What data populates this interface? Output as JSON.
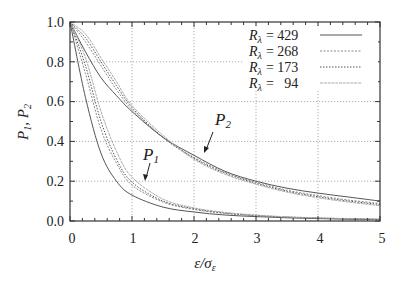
{
  "chart_data": {
    "type": "line",
    "title": "",
    "xlabel": "ε/σ_ε",
    "ylabel": "P_1, P_2",
    "xlim": [
      0,
      5
    ],
    "ylim": [
      0.0,
      1.0
    ],
    "grid": true,
    "x_ticks": [
      "0",
      "1",
      "2",
      "3",
      "4",
      "5"
    ],
    "y_ticks": [
      "0.0",
      "0.2",
      "0.4",
      "0.6",
      "0.8",
      "1.0"
    ],
    "legend_position": "upper right",
    "legend": [
      {
        "label": "R_λ = 429",
        "style": "solid",
        "color": "#555555"
      },
      {
        "label": "R_λ = 268",
        "style": "dashed",
        "color": "#888888"
      },
      {
        "label": "R_λ = 173",
        "style": "dotted",
        "color": "#555555"
      },
      {
        "label": "R_λ =   94",
        "style": "solid-light",
        "color": "#aaaaaa"
      }
    ],
    "annotations": [
      {
        "text": "P_2",
        "x": 2.35,
        "y": 0.43,
        "arrow_to": [
          2.05,
          0.31
        ]
      },
      {
        "text": "P_1",
        "x": 1.2,
        "y": 0.33,
        "arrow_to": [
          1.05,
          0.2
        ]
      }
    ],
    "x": [
      0,
      0.25,
      0.5,
      0.75,
      1,
      1.5,
      2,
      2.5,
      3,
      3.5,
      4,
      4.5,
      5
    ],
    "series": [
      {
        "name": "P_2, R_λ = 429",
        "values": [
          1.0,
          0.85,
          0.72,
          0.63,
          0.55,
          0.42,
          0.33,
          0.25,
          0.2,
          0.165,
          0.14,
          0.12,
          0.1
        ]
      },
      {
        "name": "P_2, R_λ = 268",
        "values": [
          1.0,
          0.9,
          0.78,
          0.66,
          0.56,
          0.42,
          0.32,
          0.245,
          0.195,
          0.155,
          0.128,
          0.105,
          0.088
        ]
      },
      {
        "name": "P_2, R_λ = 173",
        "values": [
          1.0,
          0.92,
          0.8,
          0.68,
          0.57,
          0.42,
          0.315,
          0.24,
          0.19,
          0.15,
          0.122,
          0.1,
          0.083
        ]
      },
      {
        "name": "P_2, R_λ = 94",
        "values": [
          1.0,
          0.94,
          0.82,
          0.7,
          0.58,
          0.43,
          0.31,
          0.235,
          0.185,
          0.145,
          0.117,
          0.095,
          0.077
        ]
      },
      {
        "name": "P_1, R_λ = 429",
        "values": [
          1.0,
          0.62,
          0.34,
          0.2,
          0.13,
          0.07,
          0.045,
          0.03,
          0.022,
          0.016,
          0.012,
          0.009,
          0.007
        ]
      },
      {
        "name": "P_1, R_λ = 268",
        "values": [
          1.0,
          0.74,
          0.46,
          0.29,
          0.18,
          0.095,
          0.058,
          0.038,
          0.026,
          0.019,
          0.014,
          0.011,
          0.008
        ]
      },
      {
        "name": "P_1, R_λ = 173",
        "values": [
          1.0,
          0.78,
          0.5,
          0.31,
          0.195,
          0.1,
          0.062,
          0.04,
          0.028,
          0.02,
          0.015,
          0.011,
          0.009
        ]
      },
      {
        "name": "P_1, R_λ = 94",
        "values": [
          1.0,
          0.82,
          0.55,
          0.35,
          0.22,
          0.11,
          0.066,
          0.043,
          0.03,
          0.021,
          0.016,
          0.012,
          0.009
        ]
      }
    ]
  },
  "labels": {
    "ylabel_main": "P",
    "ylabel_sub1": "1",
    "ylabel_sep": ", P",
    "ylabel_sub2": "2",
    "xlabel_eps": "ε/σ",
    "xlabel_sub": "ε",
    "p1": "P",
    "p1_sub": "1",
    "p2": "P",
    "p2_sub": "2",
    "legend_R": "R",
    "legend_lambda": "λ",
    "legend_values": [
      "= 429",
      "= 268",
      "= 173",
      "=   94"
    ],
    "x_ticks": [
      "0",
      "1",
      "2",
      "3",
      "4",
      "5"
    ],
    "y_ticks": [
      "0.0",
      "0.2",
      "0.4",
      "0.6",
      "0.8",
      "1.0"
    ]
  }
}
